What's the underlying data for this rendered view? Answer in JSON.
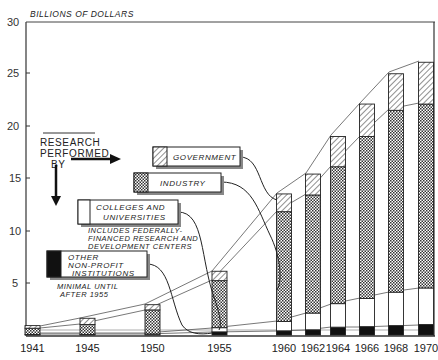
{
  "chart_data": {
    "type": "bar",
    "stacked": true,
    "title": "BILLIONS OF DOLLARS",
    "xlabel": "",
    "ylabel": "Billions of Dollars",
    "ylim": [
      0,
      30
    ],
    "yticks": [
      5,
      10,
      15,
      20,
      25,
      30
    ],
    "categories": [
      "1941",
      "1945",
      "1950",
      "1955",
      "1960",
      "1962",
      "1964",
      "1966",
      "1968",
      "1970"
    ],
    "series": [
      {
        "name": "Other Non-Profit Institutions",
        "pattern": "solid-black",
        "values": [
          0,
          0,
          0,
          0.3,
          0.4,
          0.5,
          0.75,
          0.8,
          0.9,
          1.0
        ]
      },
      {
        "name": "Colleges and Universities",
        "pattern": "white",
        "values": [
          0.05,
          0.05,
          0.1,
          0.4,
          0.9,
          1.6,
          2.25,
          2.7,
          3.2,
          3.5
        ]
      },
      {
        "name": "Industry",
        "pattern": "crosshatch",
        "values": [
          0.6,
          0.95,
          2.3,
          4.5,
          10.5,
          11.3,
          13.1,
          15.5,
          17.4,
          17.6
        ]
      },
      {
        "name": "Government",
        "pattern": "diagonal-hatch",
        "values": [
          0.25,
          0.6,
          0.5,
          0.9,
          1.7,
          2.0,
          2.9,
          3.1,
          3.5,
          4.0
        ]
      }
    ],
    "totals": [
      0.9,
      1.6,
      2.9,
      6.1,
      13.5,
      15.4,
      19.0,
      22.1,
      25.0,
      26.1
    ],
    "grid": false,
    "legend_position": "inside-left",
    "annotations": [
      "RESEARCH PERFORMED BY",
      "INCLUDES FEDERALLY-FINANCED RESEARCH AND DEVELOPMENT CENTERS",
      "MINIMAL UNTIL AFTER 1955"
    ]
  },
  "axis": {
    "title": "BILLIONS OF DOLLARS",
    "y_labels": [
      "5",
      "10",
      "15",
      "20",
      "25",
      "30"
    ]
  },
  "legend": {
    "header_lines": [
      "RESEARCH",
      "PERFORMED",
      "BY"
    ],
    "government": "GOVERNMENT",
    "industry": "INDUSTRY",
    "colleges_line1": "COLLEGES AND",
    "colleges_line2": "UNIVERSITIES",
    "colleges_note_1": "INCLUDES FEDERALLY-",
    "colleges_note_2": "FINANCED RESEARCH AND",
    "colleges_note_3": "DEVELOPMENT CENTERS",
    "other_line1": "OTHER",
    "other_line2": "NON-PROFIT",
    "other_line3": "INSTITUTIONS",
    "other_note_1": "MINIMAL UNTIL",
    "other_note_2": "AFTER 1955"
  }
}
